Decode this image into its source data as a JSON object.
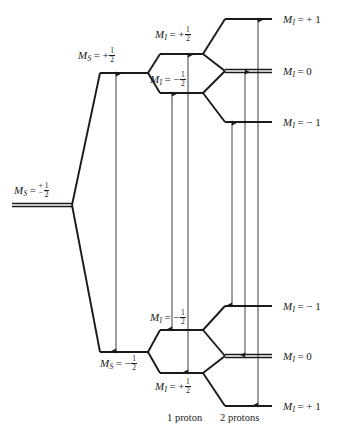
{
  "figure": {
    "type": "energy-level-diagram",
    "background_color": "#ffffff",
    "line_color": "#1a1a1a",
    "width": 344,
    "height": 436
  },
  "columns": {
    "electron_zeeman_label": "",
    "one_proton": "1 proton",
    "two_protons": "2 protons"
  },
  "levels": {
    "origin": {
      "id": "ms-degenerate",
      "label_prefix": "M",
      "label_sub": "S",
      "label_eq": "=",
      "pm_top": "+",
      "pm_bottom": "−",
      "frac_num": "1",
      "frac_den": "2",
      "x1": 12,
      "x2": 72,
      "y": 205,
      "double": true,
      "label_x": 14,
      "label_y": 182
    },
    "electron_zeeman": [
      {
        "id": "ms-plus-half",
        "label_prefix": "M",
        "label_sub": "S",
        "label_eq": "=",
        "sign": "+",
        "frac_num": "1",
        "frac_den": "2",
        "x1": 100,
        "x2": 148,
        "y": 73,
        "double": false,
        "label_x": 78,
        "label_y": 47
      },
      {
        "id": "ms-minus-half",
        "label_prefix": "M",
        "label_sub": "S",
        "label_eq": "=",
        "sign": "−",
        "frac_num": "1",
        "frac_den": "2",
        "x1": 100,
        "x2": 148,
        "y": 352,
        "double": false,
        "label_x": 100,
        "label_y": 355
      }
    ],
    "one_proton": [
      {
        "id": "ms-up-mi-plus-half",
        "label_prefix": "M",
        "label_sub": "I",
        "label_eq": "=",
        "sign": "+",
        "frac_num": "1",
        "frac_den": "2",
        "x1": 160,
        "x2": 203,
        "y": 54,
        "double": false,
        "label_x": 155,
        "label_y": 26
      },
      {
        "id": "ms-up-mi-minus-half",
        "label_prefix": "M",
        "label_sub": "I",
        "label_eq": "=",
        "sign": "−",
        "frac_num": "1",
        "frac_den": "2",
        "x1": 160,
        "x2": 203,
        "y": 93,
        "double": false,
        "label_x": 150,
        "label_y": 71
      },
      {
        "id": "ms-down-mi-minus-half",
        "label_prefix": "M",
        "label_sub": "I",
        "label_eq": "=",
        "sign": "−",
        "frac_num": "1",
        "frac_den": "2",
        "x1": 160,
        "x2": 203,
        "y": 330,
        "double": false,
        "label_x": 150,
        "label_y": 309
      },
      {
        "id": "ms-down-mi-plus-half",
        "label_prefix": "M",
        "label_sub": "I",
        "label_eq": "=",
        "sign": "+",
        "frac_num": "1",
        "frac_den": "2",
        "x1": 160,
        "x2": 203,
        "y": 373,
        "double": false,
        "label_x": 155,
        "label_y": 378
      }
    ],
    "two_protons": [
      {
        "id": "tp-top-plus-1",
        "label_prefix": "M",
        "label_sub": "I",
        "label_eq": "=",
        "sign": "+",
        "value": "1",
        "x1": 225,
        "x2": 272,
        "y": 19,
        "double": false,
        "label_x": 283,
        "label_y": 14
      },
      {
        "id": "tp-top-0",
        "label_prefix": "M",
        "label_sub": "I",
        "label_eq": "=",
        "sign": "",
        "value": "0",
        "x1": 225,
        "x2": 272,
        "y": 71,
        "double": true,
        "label_x": 283,
        "label_y": 66
      },
      {
        "id": "tp-top-minus-1",
        "label_prefix": "M",
        "label_sub": "I",
        "label_eq": "=",
        "sign": "−",
        "value": "1",
        "x1": 225,
        "x2": 272,
        "y": 122,
        "double": false,
        "label_x": 283,
        "label_y": 117
      },
      {
        "id": "tp-bot-minus-1",
        "label_prefix": "M",
        "label_sub": "I",
        "label_eq": "=",
        "sign": "−",
        "value": "1",
        "x1": 225,
        "x2": 272,
        "y": 306,
        "double": false,
        "label_x": 283,
        "label_y": 301
      },
      {
        "id": "tp-bot-0",
        "label_prefix": "M",
        "label_sub": "I",
        "label_eq": "=",
        "sign": "",
        "value": "0",
        "x1": 225,
        "x2": 272,
        "y": 356,
        "double": true,
        "label_x": 283,
        "label_y": 351
      },
      {
        "id": "tp-bot-plus-1",
        "label_prefix": "M",
        "label_sub": "I",
        "label_eq": "=",
        "sign": "+",
        "value": "1",
        "x1": 225,
        "x2": 272,
        "y": 406,
        "double": false,
        "label_x": 283,
        "label_y": 401
      }
    ]
  },
  "connectors": [
    {
      "id": "origin-to-ms-up",
      "x1": 72,
      "y1": 205,
      "x2": 100,
      "y2": 73
    },
    {
      "id": "origin-to-ms-down",
      "x1": 72,
      "y1": 205,
      "x2": 100,
      "y2": 352
    },
    {
      "id": "msup-to-mi-plus",
      "x1": 148,
      "y1": 73,
      "x2": 160,
      "y2": 54
    },
    {
      "id": "msup-to-mi-minus",
      "x1": 148,
      "y1": 73,
      "x2": 160,
      "y2": 93
    },
    {
      "id": "msdown-to-mi-minus",
      "x1": 148,
      "y1": 352,
      "x2": 160,
      "y2": 330
    },
    {
      "id": "msdown-to-mi-plus",
      "x1": 148,
      "y1": 352,
      "x2": 160,
      "y2": 373
    },
    {
      "id": "tp-a1",
      "x1": 203,
      "y1": 54,
      "x2": 225,
      "y2": 19
    },
    {
      "id": "tp-a2",
      "x1": 203,
      "y1": 54,
      "x2": 225,
      "y2": 71
    },
    {
      "id": "tp-b1",
      "x1": 203,
      "y1": 93,
      "x2": 225,
      "y2": 71
    },
    {
      "id": "tp-b2",
      "x1": 203,
      "y1": 93,
      "x2": 225,
      "y2": 122
    },
    {
      "id": "tp-c1",
      "x1": 203,
      "y1": 330,
      "x2": 225,
      "y2": 306
    },
    {
      "id": "tp-c2",
      "x1": 203,
      "y1": 330,
      "x2": 225,
      "y2": 356
    },
    {
      "id": "tp-d1",
      "x1": 203,
      "y1": 373,
      "x2": 225,
      "y2": 356
    },
    {
      "id": "tp-d2",
      "x1": 203,
      "y1": 373,
      "x2": 225,
      "y2": 406
    }
  ],
  "transitions": [
    {
      "id": "transition-no-proton",
      "group": "electron-only",
      "x": 116,
      "y_top": 73,
      "y_bottom": 352
    },
    {
      "id": "transition-1p-a",
      "group": "one-proton",
      "x": 172,
      "y_top": 93,
      "y_bottom": 330
    },
    {
      "id": "transition-1p-b",
      "group": "one-proton",
      "x": 188,
      "y_top": 54,
      "y_bottom": 373
    },
    {
      "id": "transition-2p-a",
      "group": "two-protons",
      "x": 232,
      "y_top": 122,
      "y_bottom": 306
    },
    {
      "id": "transition-2p-b",
      "group": "two-protons",
      "x": 245,
      "y_top": 71,
      "y_bottom": 356
    },
    {
      "id": "transition-2p-c",
      "group": "two-protons",
      "x": 258,
      "y_top": 19,
      "y_bottom": 406
    }
  ],
  "captions": [
    {
      "id": "caption-one-proton",
      "text": "1 proton",
      "x": 167,
      "y": 412
    },
    {
      "id": "caption-two-protons",
      "text": "2 protons",
      "x": 220,
      "y": 412
    }
  ]
}
